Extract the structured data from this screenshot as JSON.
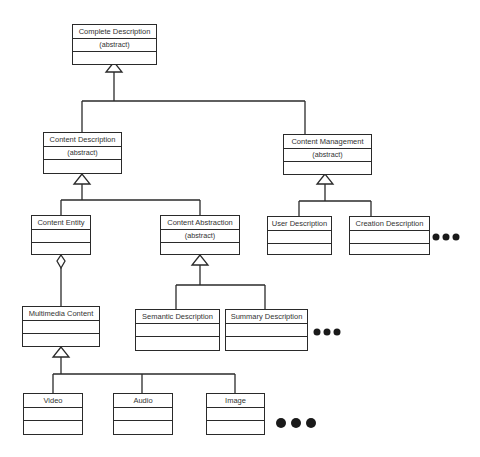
{
  "diagram": {
    "type": "UML class hierarchy",
    "classes": [
      {
        "id": "complete",
        "name": "Complete Description",
        "stereotype": "(abstract)"
      },
      {
        "id": "content_desc",
        "name": "Content Description",
        "stereotype": "(abstract)"
      },
      {
        "id": "content_mgmt",
        "name": "Content Management",
        "stereotype": "(abstract)"
      },
      {
        "id": "content_entity",
        "name": "Content Entity",
        "stereotype": ""
      },
      {
        "id": "content_abs",
        "name": "Content Abstraction",
        "stereotype": "(abstract)"
      },
      {
        "id": "user_desc",
        "name": "User Description",
        "stereotype": ""
      },
      {
        "id": "creation_desc",
        "name": "Creation Description",
        "stereotype": ""
      },
      {
        "id": "multimedia",
        "name": "Multimedia Content",
        "stereotype": ""
      },
      {
        "id": "semantic_desc",
        "name": "Semantic Description",
        "stereotype": ""
      },
      {
        "id": "summary_desc",
        "name": "Summary Description",
        "stereotype": ""
      },
      {
        "id": "video",
        "name": "Video",
        "stereotype": ""
      },
      {
        "id": "audio",
        "name": "Audio",
        "stereotype": ""
      },
      {
        "id": "image",
        "name": "Image",
        "stereotype": ""
      }
    ],
    "relations": [
      {
        "type": "generalization",
        "parent": "Complete Description",
        "children": [
          "Content Description",
          "Content Management"
        ]
      },
      {
        "type": "generalization",
        "parent": "Content Description",
        "children": [
          "Content Entity",
          "Content Abstraction"
        ]
      },
      {
        "type": "generalization",
        "parent": "Content Management",
        "children": [
          "User Description",
          "Creation Description"
        ],
        "more": true
      },
      {
        "type": "aggregation",
        "whole": "Content Entity",
        "part": "Multimedia Content"
      },
      {
        "type": "generalization",
        "parent": "Content Abstraction",
        "children": [
          "Semantic Description",
          "Summary Description"
        ],
        "more": true
      },
      {
        "type": "generalization",
        "parent": "Multimedia Content",
        "children": [
          "Video",
          "Audio",
          "Image"
        ],
        "more": true
      }
    ],
    "ellipsis": "●●●"
  }
}
